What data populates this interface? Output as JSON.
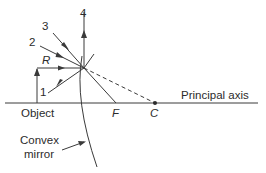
{
  "diagram": {
    "colors": {
      "line": "#3a3a3a",
      "text": "#2b2b2b",
      "background": "#ffffff"
    },
    "labels": {
      "ray_1": "1",
      "ray_2": "2",
      "ray_3": "3",
      "ray_4": "4",
      "ray_r": "R",
      "object": "Object",
      "focus": "F",
      "center": "C",
      "principal_axis": "Principal axis",
      "mirror_line1": "Convex",
      "mirror_line2": "mirror"
    }
  }
}
